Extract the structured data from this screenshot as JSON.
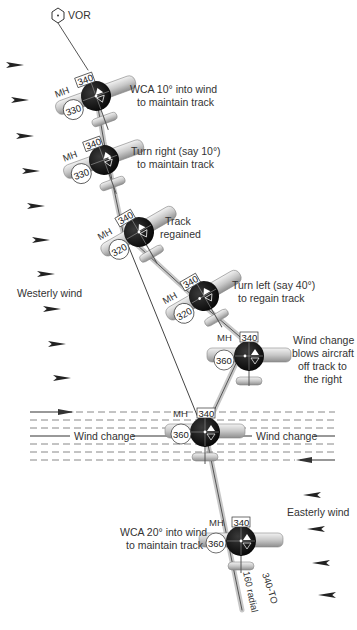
{
  "diagram": {
    "colors": {
      "background": "#ffffff",
      "text": "#333333",
      "track_line": "#555555",
      "wing": "#cfcfcf",
      "instrument": "#111111",
      "arrow": "#222222"
    },
    "vor": {
      "label": "VOR"
    },
    "wind_labels": {
      "westerly": "Westerly wind",
      "easterly": "Easterly wind",
      "change_left": "Wind change",
      "change_right": "Wind change"
    },
    "track_labels": {
      "radial": "160 radial",
      "course": "340-TO"
    },
    "aircraft": [
      {
        "id": "a1",
        "mh_label": "MH",
        "course": "340",
        "heading": "330",
        "caption": [
          "WCA 10° into wind",
          "to maintain track"
        ]
      },
      {
        "id": "a2",
        "mh_label": "MH",
        "course": "340",
        "heading": "330",
        "caption": [
          "Turn right (say 10°)",
          "to maintain track"
        ]
      },
      {
        "id": "a3",
        "mh_label": "MH",
        "course": "340",
        "heading": "320",
        "caption": [
          "Track",
          "regained"
        ]
      },
      {
        "id": "a4",
        "mh_label": "MH",
        "course": "340",
        "heading": "320",
        "caption": [
          "Turn left (say 40°)",
          "to regain track"
        ]
      },
      {
        "id": "a5",
        "mh_label": "MH",
        "course": "340",
        "heading": "360",
        "caption": [
          "Wind change",
          "blows aircraft",
          "off track to",
          "the right"
        ]
      },
      {
        "id": "a6",
        "mh_label": "MH",
        "course": "340",
        "heading": "360",
        "caption": []
      },
      {
        "id": "a7",
        "mh_label": "MH",
        "course": "340",
        "heading": "360",
        "caption": [
          "WCA 20° into wind",
          "to maintain track"
        ]
      }
    ]
  }
}
